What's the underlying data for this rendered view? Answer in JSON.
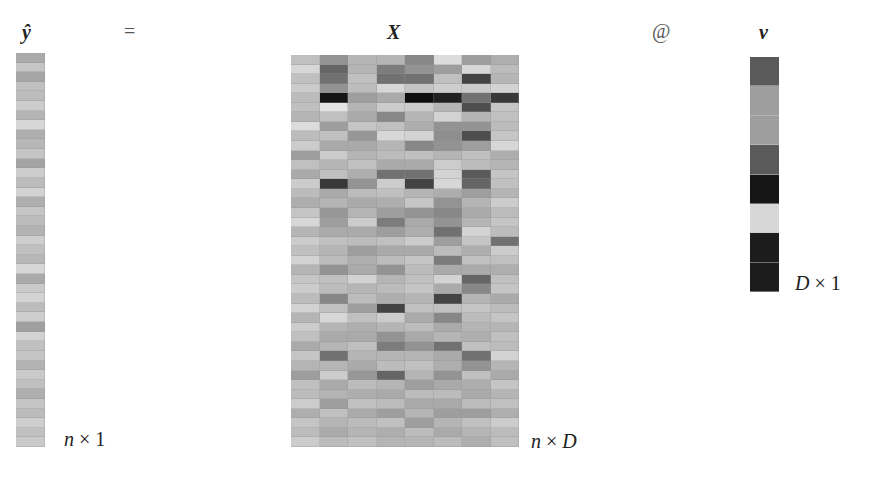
{
  "labels": {
    "yhat": "ŷ",
    "equals": "=",
    "X": "X",
    "matmul": "@",
    "v": "v",
    "yhat_dim": {
      "left": "n",
      "times": " × ",
      "right": "1"
    },
    "X_dim": {
      "left": "n",
      "times": " × ",
      "right": "D"
    },
    "v_dim": {
      "left": "D",
      "times": " × ",
      "right": "1"
    }
  },
  "chart_data": {
    "type": "heatmap",
    "grayscale": "0 = white, 1 = black",
    "yhat": {
      "shape": [
        41,
        1
      ],
      "values": [
        0.3,
        0.18,
        0.32,
        0.2,
        0.22,
        0.15,
        0.25,
        0.1,
        0.28,
        0.24,
        0.18,
        0.33,
        0.15,
        0.22,
        0.12,
        0.28,
        0.18,
        0.22,
        0.26,
        0.14,
        0.2,
        0.24,
        0.1,
        0.3,
        0.16,
        0.12,
        0.22,
        0.14,
        0.34,
        0.12,
        0.2,
        0.18,
        0.26,
        0.16,
        0.2,
        0.28,
        0.18,
        0.22,
        0.14,
        0.2,
        0.16
      ]
    },
    "X": {
      "shape": [
        41,
        8
      ],
      "values": [
        [
          0.2,
          0.4,
          0.25,
          0.25,
          0.45,
          0.08,
          0.35,
          0.28
        ],
        [
          0.1,
          0.6,
          0.25,
          0.5,
          0.4,
          0.35,
          0.1,
          0.22
        ],
        [
          0.2,
          0.55,
          0.2,
          0.55,
          0.55,
          0.2,
          0.75,
          0.25
        ],
        [
          0.15,
          0.4,
          0.22,
          0.1,
          0.18,
          0.14,
          0.15,
          0.12
        ],
        [
          0.22,
          0.95,
          0.35,
          0.3,
          0.98,
          0.9,
          0.55,
          0.8
        ],
        [
          0.2,
          0.05,
          0.25,
          0.15,
          0.15,
          0.25,
          0.7,
          0.18
        ],
        [
          0.25,
          0.2,
          0.3,
          0.45,
          0.25,
          0.12,
          0.25,
          0.2
        ],
        [
          0.08,
          0.35,
          0.18,
          0.2,
          0.28,
          0.4,
          0.4,
          0.22
        ],
        [
          0.22,
          0.2,
          0.38,
          0.1,
          0.12,
          0.42,
          0.7,
          0.18
        ],
        [
          0.15,
          0.3,
          0.3,
          0.25,
          0.45,
          0.4,
          0.35,
          0.1
        ],
        [
          0.35,
          0.15,
          0.25,
          0.22,
          0.2,
          0.25,
          0.2,
          0.28
        ],
        [
          0.2,
          0.25,
          0.2,
          0.3,
          0.3,
          0.15,
          0.22,
          0.25
        ],
        [
          0.3,
          0.2,
          0.28,
          0.55,
          0.55,
          0.12,
          0.65,
          0.18
        ],
        [
          0.15,
          0.8,
          0.4,
          0.15,
          0.75,
          0.1,
          0.6,
          0.2
        ],
        [
          0.22,
          0.3,
          0.22,
          0.2,
          0.25,
          0.28,
          0.35,
          0.25
        ],
        [
          0.28,
          0.25,
          0.3,
          0.28,
          0.18,
          0.4,
          0.25,
          0.15
        ],
        [
          0.18,
          0.38,
          0.25,
          0.35,
          0.4,
          0.45,
          0.3,
          0.22
        ],
        [
          0.1,
          0.35,
          0.15,
          0.5,
          0.3,
          0.4,
          0.25,
          0.18
        ],
        [
          0.25,
          0.3,
          0.3,
          0.35,
          0.28,
          0.55,
          0.12,
          0.22
        ],
        [
          0.15,
          0.2,
          0.22,
          0.2,
          0.15,
          0.35,
          0.18,
          0.55
        ],
        [
          0.2,
          0.25,
          0.35,
          0.3,
          0.3,
          0.22,
          0.28,
          0.15
        ],
        [
          0.12,
          0.22,
          0.28,
          0.22,
          0.18,
          0.5,
          0.2,
          0.2
        ],
        [
          0.25,
          0.4,
          0.3,
          0.4,
          0.22,
          0.3,
          0.3,
          0.28
        ],
        [
          0.18,
          0.2,
          0.12,
          0.25,
          0.2,
          0.12,
          0.6,
          0.2
        ],
        [
          0.15,
          0.22,
          0.25,
          0.22,
          0.18,
          0.3,
          0.45,
          0.18
        ],
        [
          0.22,
          0.45,
          0.22,
          0.28,
          0.25,
          0.75,
          0.25,
          0.3
        ],
        [
          0.12,
          0.2,
          0.35,
          0.75,
          0.2,
          0.2,
          0.18,
          0.22
        ],
        [
          0.25,
          0.1,
          0.2,
          0.15,
          0.3,
          0.45,
          0.22,
          0.18
        ],
        [
          0.15,
          0.25,
          0.28,
          0.25,
          0.22,
          0.3,
          0.25,
          0.25
        ],
        [
          0.2,
          0.3,
          0.3,
          0.4,
          0.3,
          0.25,
          0.28,
          0.2
        ],
        [
          0.3,
          0.25,
          0.2,
          0.5,
          0.4,
          0.55,
          0.2,
          0.22
        ],
        [
          0.18,
          0.55,
          0.25,
          0.25,
          0.25,
          0.3,
          0.55,
          0.12
        ],
        [
          0.25,
          0.25,
          0.3,
          0.22,
          0.2,
          0.28,
          0.4,
          0.25
        ],
        [
          0.35,
          0.15,
          0.38,
          0.6,
          0.25,
          0.4,
          0.2,
          0.3
        ],
        [
          0.2,
          0.3,
          0.22,
          0.25,
          0.35,
          0.3,
          0.28,
          0.18
        ],
        [
          0.22,
          0.25,
          0.28,
          0.3,
          0.22,
          0.22,
          0.3,
          0.25
        ],
        [
          0.15,
          0.35,
          0.2,
          0.22,
          0.3,
          0.3,
          0.22,
          0.2
        ],
        [
          0.28,
          0.2,
          0.3,
          0.35,
          0.25,
          0.35,
          0.35,
          0.28
        ],
        [
          0.18,
          0.25,
          0.22,
          0.2,
          0.35,
          0.25,
          0.2,
          0.15
        ],
        [
          0.22,
          0.3,
          0.25,
          0.28,
          0.22,
          0.3,
          0.25,
          0.22
        ],
        [
          0.15,
          0.22,
          0.2,
          0.25,
          0.25,
          0.22,
          0.28,
          0.2
        ]
      ]
    },
    "v": {
      "shape": [
        8,
        1
      ],
      "values": [
        0.65,
        0.35,
        0.35,
        0.65,
        0.95,
        0.1,
        0.92,
        0.92
      ]
    }
  }
}
